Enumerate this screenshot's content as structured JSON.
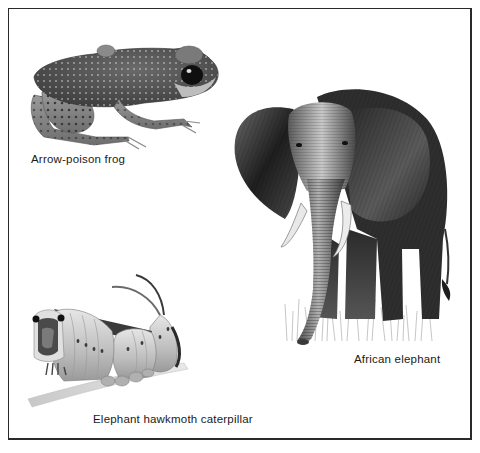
{
  "plate": {
    "border_color": "#2a2a2a",
    "background": "#ffffff"
  },
  "figures": [
    {
      "id": "frog",
      "caption": "Arrow-poison frog",
      "illustration": "frog-illustration"
    },
    {
      "id": "elephant",
      "caption": "African elephant",
      "illustration": "elephant-illustration"
    },
    {
      "id": "caterpillar",
      "caption": "Elephant hawkmoth caterpillar",
      "illustration": "caterpillar-illustration"
    }
  ]
}
